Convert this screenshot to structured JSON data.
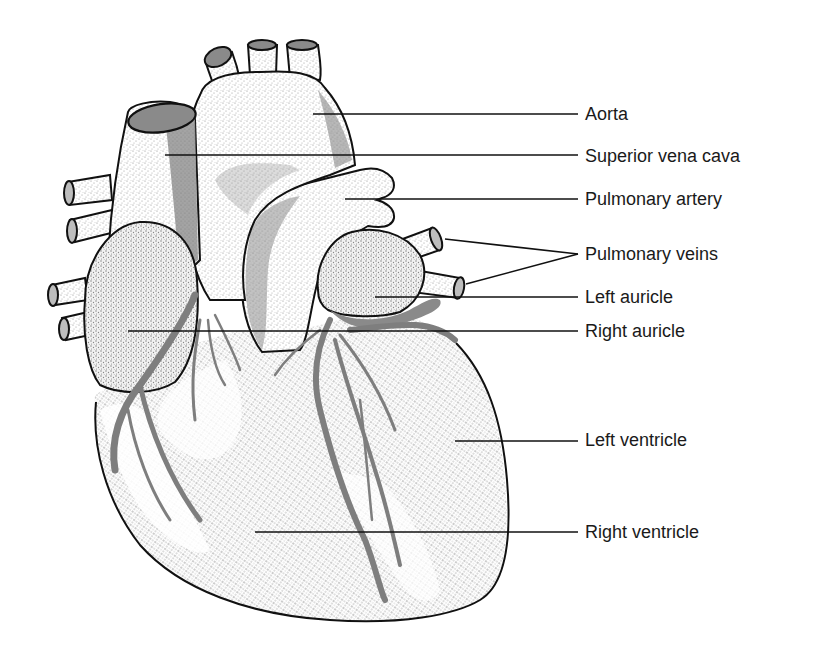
{
  "diagram": {
    "colors": {
      "background": "#ffffff",
      "outline": "#111111",
      "stipple_light": "#bdbdbd",
      "shadow": "#8a8a8a",
      "coronary": "#7e7e7e",
      "text": "#1a1a1a"
    },
    "labels": [
      {
        "id": "aorta",
        "text": "Aorta",
        "x": 585,
        "y": 104,
        "line": [
          [
            313,
            114
          ],
          [
            578,
            114
          ]
        ]
      },
      {
        "id": "superior-vena-cava",
        "text": "Superior vena cava",
        "x": 585,
        "y": 146,
        "line": [
          [
            165,
            155
          ],
          [
            578,
            155
          ]
        ]
      },
      {
        "id": "pulmonary-artery",
        "text": "Pulmonary artery",
        "x": 585,
        "y": 189,
        "line": [
          [
            345,
            199
          ],
          [
            578,
            199
          ]
        ]
      },
      {
        "id": "pulmonary-veins",
        "text": "Pulmonary veins",
        "x": 585,
        "y": 244,
        "line": [
          [
            445,
            239
          ],
          [
            578,
            254
          ]
        ],
        "line2": [
          [
            466,
            284
          ],
          [
            578,
            254
          ]
        ]
      },
      {
        "id": "left-auricle",
        "text": "Left auricle",
        "x": 585,
        "y": 287,
        "line": [
          [
            375,
            297
          ],
          [
            578,
            297
          ]
        ]
      },
      {
        "id": "right-auricle",
        "text": "Right auricle",
        "x": 585,
        "y": 321,
        "line": [
          [
            128,
            331
          ],
          [
            578,
            331
          ]
        ]
      },
      {
        "id": "left-ventricle",
        "text": "Left ventricle",
        "x": 585,
        "y": 430,
        "line": [
          [
            455,
            441
          ],
          [
            578,
            441
          ]
        ]
      },
      {
        "id": "right-ventricle",
        "text": "Right ventricle",
        "x": 585,
        "y": 522,
        "line": [
          [
            255,
            532
          ],
          [
            578,
            532
          ]
        ]
      }
    ]
  }
}
